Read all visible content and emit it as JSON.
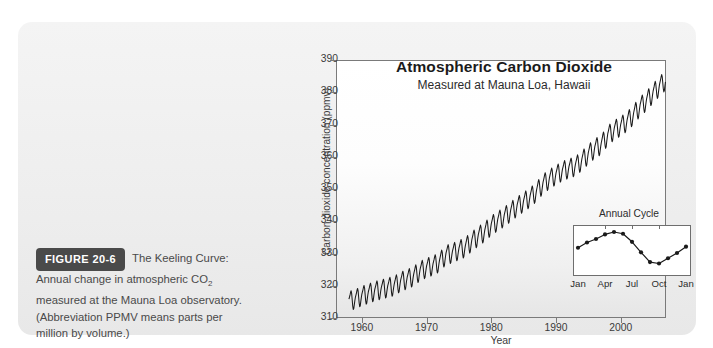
{
  "figure": {
    "badge": "FIGURE 20-6",
    "caption_lead": "The Keeling Curve:",
    "caption_line1": "Annual change in atmospheric CO",
    "caption_sub": "2",
    "caption_line2": "measured at the Mauna Loa observatory.",
    "caption_line3": "(Abbreviation PPMV means parts per",
    "caption_line4": "million by volume.)"
  },
  "colors": {
    "panel_bg": "#eeeeee",
    "badge_bg": "#4a4a4a",
    "curve": "#1a1a1a",
    "frame": "#7a7a7a",
    "text": "#3b3b3b"
  },
  "chart_data": [
    {
      "type": "line",
      "id": "keeling-curve",
      "title": "Atmospheric Carbon Dioxide",
      "subtitle": "Measured at Mauna Loa, Hawaii",
      "xlabel": "Year",
      "ylabel": "Carbon dioxide concentration (ppmv)",
      "xlim": [
        1956,
        2007
      ],
      "ylim": [
        310,
        390
      ],
      "yticks": [
        310,
        320,
        330,
        340,
        350,
        360,
        370,
        380,
        390
      ],
      "xticks": [
        1960,
        1970,
        1980,
        1990,
        2000
      ],
      "grid": false,
      "legend": "none",
      "seasonal_amplitude_ppm": 3.0,
      "series": [
        {
          "name": "Monthly mean CO2 (ppmv)",
          "x": [
            1958,
            1959,
            1960,
            1961,
            1962,
            1963,
            1964,
            1965,
            1966,
            1967,
            1968,
            1969,
            1970,
            1971,
            1972,
            1973,
            1974,
            1975,
            1976,
            1977,
            1978,
            1979,
            1980,
            1981,
            1982,
            1983,
            1984,
            1985,
            1986,
            1987,
            1988,
            1989,
            1990,
            1991,
            1992,
            1993,
            1994,
            1995,
            1996,
            1997,
            1998,
            1999,
            2000,
            2001,
            2002,
            2003,
            2004,
            2005,
            2006
          ],
          "values": [
            315.3,
            315.9,
            316.9,
            317.6,
            318.4,
            318.9,
            319.5,
            320.0,
            321.3,
            322.1,
            323.0,
            324.6,
            325.6,
            326.3,
            327.4,
            329.6,
            330.2,
            331.1,
            332.0,
            333.8,
            335.4,
            336.8,
            338.7,
            340.1,
            341.4,
            343.0,
            344.6,
            346.0,
            347.4,
            349.2,
            351.6,
            353.1,
            354.4,
            355.6,
            356.4,
            357.1,
            358.8,
            360.8,
            362.6,
            363.8,
            366.6,
            368.3,
            369.5,
            371.0,
            373.1,
            375.6,
            377.4,
            379.7,
            381.9
          ]
        }
      ]
    },
    {
      "type": "line",
      "id": "annual-cycle-inset",
      "title": "Annual Cycle",
      "xlabel": "",
      "ylabel": "",
      "grid": false,
      "legend": "none",
      "xticks": [
        "Jan",
        "Apr",
        "Jul",
        "Oct",
        "Jan"
      ],
      "categories": [
        "Jan",
        "Feb",
        "Mar",
        "Apr",
        "May",
        "Jun",
        "Jul",
        "Aug",
        "Sep",
        "Oct",
        "Nov",
        "Dec",
        "Jan"
      ],
      "values": [
        0.55,
        0.7,
        0.8,
        0.93,
        1.0,
        0.95,
        0.72,
        0.42,
        0.14,
        0.1,
        0.25,
        0.4,
        0.58
      ],
      "markers": true
    }
  ]
}
